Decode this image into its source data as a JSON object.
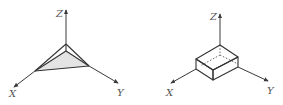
{
  "figures": [
    {
      "name": "triangular-pyramid",
      "axes": {
        "x_label": "X",
        "y_label": "Y",
        "z_label": "Z"
      },
      "colors": {
        "stroke": "#333333",
        "face_fill": "#e4e4e4"
      }
    },
    {
      "name": "rectangular-box",
      "axes": {
        "x_label": "X",
        "y_label": "Y",
        "z_label": "Z"
      },
      "colors": {
        "stroke": "#333333",
        "face_fill": "#ffffff"
      }
    }
  ]
}
